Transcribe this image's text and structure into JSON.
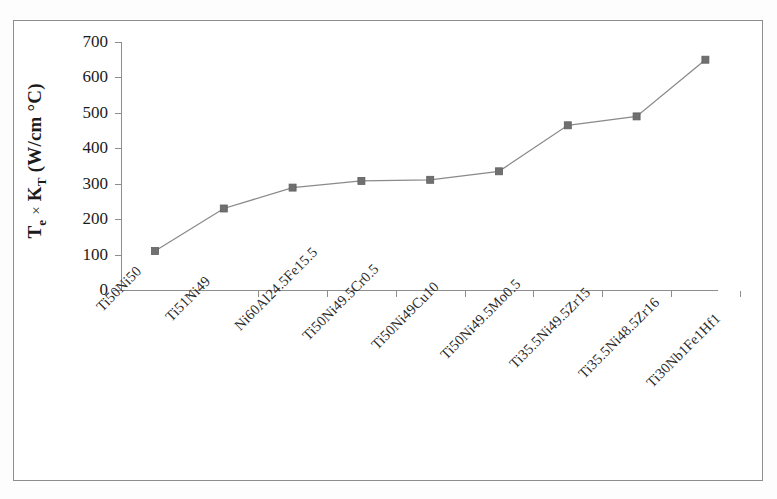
{
  "chart_data": {
    "type": "line",
    "title": "",
    "xlabel": "",
    "ylabel": "Te × KT (W/cm °C)",
    "ylabel_parts": {
      "base1": "T",
      "sub1": "e",
      "times": "×",
      "base2": "K",
      "sub2": "T",
      "units": "(W/cm °C)"
    },
    "categories": [
      "Ti50Ni50",
      "Ti51Ni49",
      "Ni60Al24.5Fe15.5",
      "Ti50Ni49.5Cr0.5",
      "Ti50Ni49Cu10",
      "Ti50Ni49.5Mo0.5",
      "Ti35.5Ni49.5Zr15",
      "Ti35.5Ni48.5Zr16",
      "Ti30Nb1Fe1Hf1"
    ],
    "values": [
      110,
      230,
      289,
      308,
      311,
      335,
      465,
      490,
      650
    ],
    "ytick_labels": [
      "700",
      "600",
      "500",
      "400",
      "300",
      "200",
      "100",
      "0"
    ],
    "ytick_values": [
      700,
      600,
      500,
      400,
      300,
      200,
      100,
      0
    ],
    "ylim": [
      0,
      700
    ],
    "grid": false,
    "legend": null,
    "series_color": "#808080",
    "marker": "square",
    "marker_color": "#707070",
    "line_color": "#8a8a8a",
    "axis_color": "#8d8d8d"
  }
}
